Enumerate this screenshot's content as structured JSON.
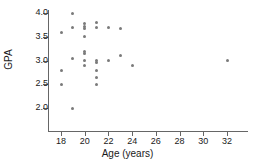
{
  "chart_data": {
    "type": "scatter",
    "title": "",
    "xlabel": "Age (years)",
    "ylabel": "GPA",
    "xlim": [
      17,
      33
    ],
    "ylim": [
      1.85,
      4.1
    ],
    "xticks": [
      18,
      20,
      22,
      24,
      26,
      28,
      30,
      32
    ],
    "xtick_labels": [
      "18",
      "20",
      "22",
      "24",
      "26",
      "28",
      "30",
      "32"
    ],
    "yticks": [
      2.0,
      2.5,
      3.0,
      3.5,
      4.0
    ],
    "ytick_labels": [
      "2.0",
      "2.5",
      "3.0",
      "3.5",
      "4.0"
    ],
    "grid": false,
    "legend": false,
    "marker_color": "#7a7a7a",
    "axis_color": "#666666",
    "points": [
      {
        "x": 18,
        "y": 3.6
      },
      {
        "x": 18,
        "y": 2.8
      },
      {
        "x": 18,
        "y": 2.5
      },
      {
        "x": 19,
        "y": 4.0
      },
      {
        "x": 19,
        "y": 3.7
      },
      {
        "x": 19,
        "y": 3.05
      },
      {
        "x": 19,
        "y": 2.0
      },
      {
        "x": 20,
        "y": 3.78
      },
      {
        "x": 20,
        "y": 3.72
      },
      {
        "x": 20,
        "y": 3.68
      },
      {
        "x": 20,
        "y": 3.5
      },
      {
        "x": 20,
        "y": 3.2
      },
      {
        "x": 20,
        "y": 3.14
      },
      {
        "x": 20,
        "y": 3.0
      },
      {
        "x": 20,
        "y": 2.9
      },
      {
        "x": 21,
        "y": 3.8
      },
      {
        "x": 21,
        "y": 3.7
      },
      {
        "x": 21,
        "y": 3.0
      },
      {
        "x": 21,
        "y": 2.95
      },
      {
        "x": 21,
        "y": 2.8
      },
      {
        "x": 21,
        "y": 2.65
      },
      {
        "x": 21,
        "y": 2.5
      },
      {
        "x": 22,
        "y": 3.7
      },
      {
        "x": 22,
        "y": 3.0
      },
      {
        "x": 23,
        "y": 3.67
      },
      {
        "x": 23,
        "y": 3.1
      },
      {
        "x": 24,
        "y": 2.9
      },
      {
        "x": 32,
        "y": 3.0
      }
    ]
  },
  "axes": {
    "ylabel_text": "GPA",
    "xlabel_text": "Age (years)"
  }
}
